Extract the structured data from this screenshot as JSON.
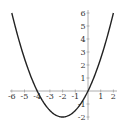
{
  "chart_data": {
    "type": "line",
    "title": "",
    "xlabel": "",
    "ylabel": "",
    "function": "y = 0.5x^2 + 2x",
    "series": [
      {
        "name": "parabola",
        "x": [
          -6,
          -5,
          -4,
          -3,
          -2,
          -1,
          0,
          1,
          2
        ],
        "values": [
          6,
          2.5,
          0,
          -1.5,
          -2,
          -1.5,
          0,
          2.5,
          6
        ]
      }
    ],
    "xlim": [
      -6.2,
      2.3
    ],
    "ylim": [
      -2.2,
      6.2
    ],
    "xticks": [
      "-6",
      "-5",
      "-4",
      "-3",
      "-2",
      "-1",
      "1",
      "2"
    ],
    "yticks": [
      "6",
      "5",
      "4",
      "3",
      "2",
      "1",
      "-1",
      "-2"
    ],
    "grid": false,
    "curve_color": "#222222",
    "axis_color": "#999999"
  }
}
